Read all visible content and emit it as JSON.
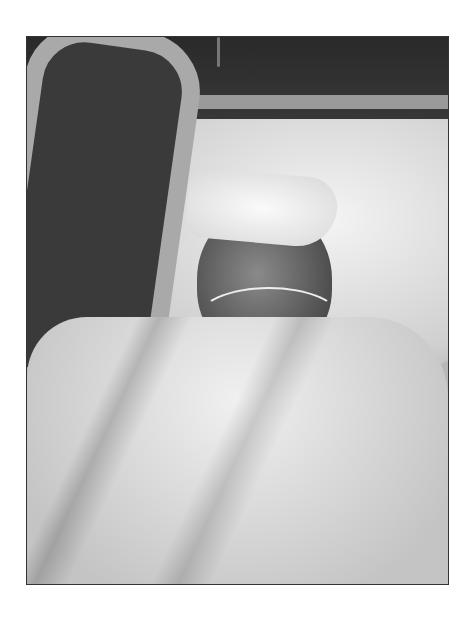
{
  "image": {
    "description": "Black-and-white photograph of a man lying in a hospital bed, eyes closed, with a folded white towel on his forehead, a nasal oxygen cannula, covered with a white blanket; bed rail at left, dark wall with electrical outlet in background.",
    "elements": [
      "bed-rail",
      "dark-wall",
      "wall-outlet",
      "pillow",
      "towel",
      "patient-face",
      "oxygen-cannula",
      "blanket"
    ],
    "colors": {
      "page_background": "#ffffff",
      "frame_border": "#333333"
    }
  }
}
